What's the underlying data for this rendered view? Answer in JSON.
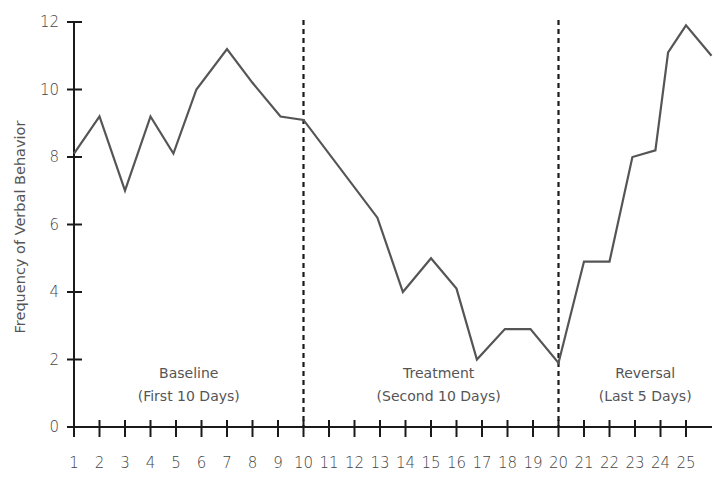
{
  "chart_data": {
    "type": "line",
    "title": "",
    "xlabel": "",
    "ylabel": "Frequency of Verbal Behavior",
    "ylim": [
      0,
      12
    ],
    "yticks": [
      0,
      2,
      4,
      6,
      8,
      10,
      12
    ],
    "xticks": [
      1,
      2,
      3,
      4,
      5,
      6,
      7,
      8,
      9,
      10,
      11,
      12,
      13,
      14,
      15,
      16,
      17,
      18,
      19,
      20,
      21,
      22,
      23,
      24,
      25
    ],
    "grid": false,
    "legend": null,
    "series": [
      {
        "name": "Verbal Behavior",
        "color": "#555555",
        "points": [
          {
            "x": 1,
            "y": 8.1
          },
          {
            "x": 2,
            "y": 9.2
          },
          {
            "x": 3,
            "y": 7.0
          },
          {
            "x": 4,
            "y": 9.2
          },
          {
            "x": 4.9,
            "y": 8.1
          },
          {
            "x": 5.8,
            "y": 10.0
          },
          {
            "x": 7,
            "y": 11.2
          },
          {
            "x": 8,
            "y": 10.2
          },
          {
            "x": 9.1,
            "y": 9.2
          },
          {
            "x": 10,
            "y": 9.1
          },
          {
            "x": 12.9,
            "y": 6.2
          },
          {
            "x": 13.9,
            "y": 4.0
          },
          {
            "x": 15,
            "y": 5.0
          },
          {
            "x": 16,
            "y": 4.1
          },
          {
            "x": 16.8,
            "y": 2.0
          },
          {
            "x": 17.9,
            "y": 2.9
          },
          {
            "x": 18.9,
            "y": 2.9
          },
          {
            "x": 20,
            "y": 1.9
          },
          {
            "x": 21,
            "y": 4.9
          },
          {
            "x": 22,
            "y": 4.9
          },
          {
            "x": 22.9,
            "y": 8.0
          },
          {
            "x": 23.8,
            "y": 8.2
          },
          {
            "x": 24.3,
            "y": 11.1
          },
          {
            "x": 25,
            "y": 11.9
          },
          {
            "x": 26,
            "y": 11.0
          }
        ]
      }
    ],
    "phase_lines": [
      10,
      20
    ],
    "annotations": [
      {
        "line1": "Baseline",
        "line2": "(First 10 Days)",
        "x_center": 5.5
      },
      {
        "line1": "Treatment",
        "line2": "(Second 10 Days)",
        "x_center": 15.3
      },
      {
        "line1": "Reversal",
        "line2": "(Last 5 Days)",
        "x_center": 23.4
      }
    ]
  },
  "layout": {
    "axis_color": "#1a1a1a",
    "line_color": "#555555",
    "phase_line_color": "#1a1a1a"
  }
}
